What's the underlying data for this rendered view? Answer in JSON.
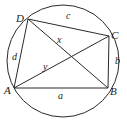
{
  "figure": {
    "type": "cyclic-quadrilateral",
    "circle": {
      "cx": 63,
      "cy": 61,
      "r": 56
    },
    "vertices": [
      {
        "name": "A",
        "x": 14,
        "y": 88,
        "label_x": 4,
        "label_y": 94
      },
      {
        "name": "B",
        "x": 108,
        "y": 88,
        "label_x": 110,
        "label_y": 95
      },
      {
        "name": "C",
        "x": 109,
        "y": 36,
        "label_x": 111,
        "label_y": 39
      },
      {
        "name": "D",
        "x": 28,
        "y": 19,
        "label_x": 16,
        "label_y": 22
      }
    ],
    "sides": [
      {
        "name": "a",
        "from": "A",
        "to": "B",
        "label_x": 58,
        "label_y": 99
      },
      {
        "name": "b",
        "from": "B",
        "to": "C",
        "label_x": 115,
        "label_y": 64
      },
      {
        "name": "c",
        "from": "C",
        "to": "D",
        "label_x": 66,
        "label_y": 19
      },
      {
        "name": "d",
        "from": "D",
        "to": "A",
        "label_x": 12,
        "label_y": 60
      }
    ],
    "diagonals": [
      {
        "name": "x",
        "from": "D",
        "to": "B",
        "label_x": 57,
        "label_y": 43
      },
      {
        "name": "y",
        "from": "A",
        "to": "C",
        "label_x": 43,
        "label_y": 70
      }
    ]
  },
  "labels": {
    "A": "A",
    "B": "B",
    "C": "C",
    "D": "D",
    "a": "a",
    "b": "b",
    "c": "c",
    "d": "d",
    "x": "x",
    "y": "y"
  }
}
